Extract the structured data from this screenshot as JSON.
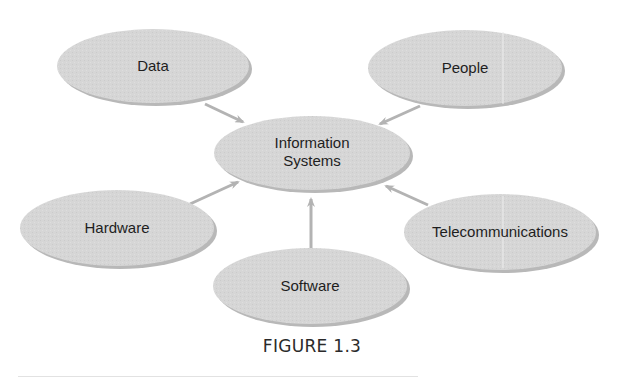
{
  "figure": {
    "caption": "FIGURE 1.3",
    "center_node": {
      "line1": "Information",
      "line2": "Systems"
    },
    "nodes": [
      {
        "id": "data",
        "label": "Data"
      },
      {
        "id": "people",
        "label": "People"
      },
      {
        "id": "hardware",
        "label": "Hardware"
      },
      {
        "id": "software",
        "label": "Software"
      },
      {
        "id": "telecommunications",
        "label": "Telecommunications"
      }
    ],
    "edges": [
      {
        "from": "Data",
        "to": "Information Systems"
      },
      {
        "from": "People",
        "to": "Information Systems"
      },
      {
        "from": "Hardware",
        "to": "Information Systems"
      },
      {
        "from": "Software",
        "to": "Information Systems"
      },
      {
        "from": "Telecommunications",
        "to": "Information Systems"
      }
    ],
    "colors": {
      "node_fill": "#d6d6d6",
      "node_shadow": "#9a9a9a",
      "arrow": "#b3b3b3",
      "text": "#1e1e1e"
    }
  }
}
